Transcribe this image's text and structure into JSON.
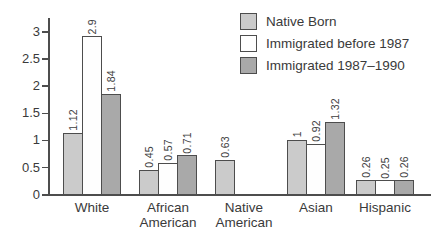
{
  "colors": {
    "background": "#ffffff",
    "axis": "#4d4d4d",
    "bar_border": "#4d4d4d",
    "text": "#3a3a3a",
    "series_native_born": "#cbcbcb",
    "series_before_1987": "#fefefe",
    "series_1987_1990": "#a9a9a9"
  },
  "chart_data": {
    "type": "bar",
    "title": "",
    "xlabel": "",
    "ylabel": "",
    "categories": [
      "White",
      "African American",
      "Native American",
      "Asian",
      "Hispanic"
    ],
    "series": [
      {
        "name": "Native Born",
        "color": "#cbcbcb",
        "values": [
          1.12,
          0.45,
          0.63,
          1,
          0.26
        ],
        "value_labels": [
          "1.12",
          "0.45",
          "0.63",
          "1",
          "0.26"
        ]
      },
      {
        "name": "Immigrated before 1987",
        "color": "#fefefe",
        "values": [
          2.9,
          0.57,
          null,
          0.92,
          0.25
        ],
        "value_labels": [
          "2.9",
          "0.57",
          null,
          "0.92",
          "0.25"
        ]
      },
      {
        "name": "Immigrated 1987–1990",
        "color": "#a9a9a9",
        "values": [
          1.84,
          0.71,
          null,
          1.32,
          0.26
        ],
        "value_labels": [
          "1.84",
          "0.71",
          null,
          "1.32",
          "0.26"
        ]
      }
    ],
    "ylim": [
      0,
      3
    ],
    "yticks": [
      0,
      0.5,
      1,
      1.5,
      2,
      2.5,
      3
    ],
    "ytick_labels": [
      "0",
      "0.5",
      "1",
      "1.5",
      "2",
      "2.5",
      "3"
    ],
    "grid": false,
    "legend_position": "top-right",
    "bar_value_labels_rotated": true
  }
}
